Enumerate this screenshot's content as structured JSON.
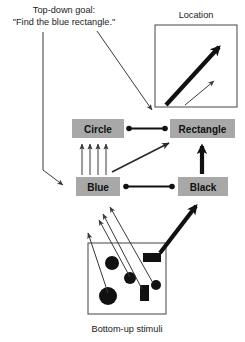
{
  "figure": {
    "title_line1": "Top-down goal:",
    "title_line2": "\"Find the blue rectangle.\"",
    "location_label": "Location",
    "caption": "Bottom-up stimuli"
  },
  "nodes": [
    {
      "id": "circle",
      "label": "Circle",
      "x": 72,
      "y": 119,
      "w": 52,
      "h": 19
    },
    {
      "id": "rectangle",
      "label": "Rectangle",
      "x": 170,
      "y": 119,
      "w": 65,
      "h": 19
    },
    {
      "id": "blue",
      "label": "Blue",
      "x": 76,
      "y": 177,
      "w": 44,
      "h": 19
    },
    {
      "id": "black",
      "label": "Black",
      "x": 178,
      "y": 177,
      "w": 50,
      "h": 19
    }
  ],
  "colors": {
    "node_fill": "#a8a8a8",
    "stroke": "#111111",
    "thin_stroke": "#3a3a3a",
    "frame_stroke": "#555555",
    "background": "#ffffff",
    "shape_fill": "#111111"
  },
  "location_box": {
    "x": 155,
    "y": 25,
    "w": 82,
    "h": 82
  },
  "stimuli_box": {
    "x": 88,
    "y": 243,
    "w": 78,
    "h": 71
  },
  "stimuli_shapes": [
    {
      "type": "circle",
      "cx": 112,
      "cy": 263,
      "r": 7
    },
    {
      "type": "circle",
      "cx": 130,
      "cy": 278,
      "r": 6
    },
    {
      "type": "circle",
      "cx": 108,
      "cy": 296,
      "r": 9
    },
    {
      "type": "circle",
      "cx": 156,
      "cy": 285,
      "r": 5
    },
    {
      "type": "rect",
      "x": 143,
      "y": 253,
      "w": 18,
      "h": 9
    },
    {
      "type": "rect",
      "x": 140,
      "y": 285,
      "w": 9,
      "h": 16
    }
  ],
  "location_arrows": [
    {
      "weight": "thick",
      "x1": 166,
      "y1": 106,
      "x2": 221,
      "y2": 45
    },
    {
      "weight": "thin",
      "x1": 184,
      "y1": 106,
      "x2": 216,
      "y2": 80
    }
  ],
  "connections": [
    {
      "id": "goal-to-blue",
      "kind": "elbow-arrow",
      "weight": "thin"
    },
    {
      "id": "goal-to-rectangle",
      "kind": "arrow",
      "weight": "thin"
    },
    {
      "id": "circle-rectangle",
      "kind": "dot-link",
      "weight": "medium"
    },
    {
      "id": "blue-black",
      "kind": "dot-link",
      "weight": "medium"
    },
    {
      "id": "blue-to-circle-1",
      "kind": "arrow",
      "weight": "thin"
    },
    {
      "id": "blue-to-circle-2",
      "kind": "arrow",
      "weight": "thin"
    },
    {
      "id": "blue-to-circle-3",
      "kind": "arrow",
      "weight": "thin"
    },
    {
      "id": "blue-to-circle-4",
      "kind": "arrow",
      "weight": "thin"
    },
    {
      "id": "blue-to-rectangle",
      "kind": "arrow",
      "weight": "medium"
    },
    {
      "id": "black-to-rectangle",
      "kind": "arrow",
      "weight": "thick"
    },
    {
      "id": "stimuli-to-blue-1",
      "kind": "arrow",
      "weight": "thin"
    },
    {
      "id": "stimuli-to-blue-2",
      "kind": "arrow",
      "weight": "thin"
    },
    {
      "id": "stimuli-to-blue-3",
      "kind": "arrow",
      "weight": "thin"
    },
    {
      "id": "stimuli-to-blue-4",
      "kind": "arrow",
      "weight": "thin"
    },
    {
      "id": "stimuli-to-black",
      "kind": "arrow",
      "weight": "thick"
    }
  ]
}
